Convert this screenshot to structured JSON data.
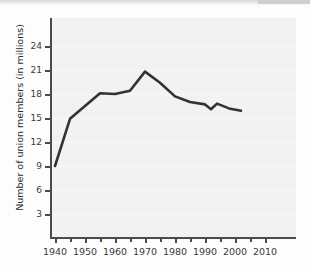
{
  "figure": {
    "y_axis_title": "Number of union members (in millions)"
  },
  "chart_data": {
    "type": "line",
    "title": "",
    "xlabel": "",
    "ylabel": "Number of union members (in millions)",
    "xlim": [
      1936,
      2014
    ],
    "ylim": [
      0,
      26
    ],
    "grid": true,
    "legend": "none",
    "line_color": "#333333",
    "plot_background": "#f2f2f2",
    "x_major_ticks": [
      1940,
      1950,
      1960,
      1970,
      1980,
      1990,
      2000,
      2010
    ],
    "x_minor_ticks": [
      1945,
      1955,
      1965,
      1975,
      1985,
      1995,
      2005
    ],
    "x_tick_labels": [
      "1940",
      "1950",
      "1960",
      "1970",
      "1980",
      "1990",
      "2000",
      "2010"
    ],
    "y_ticks": [
      3,
      6,
      9,
      12,
      15,
      18,
      21,
      24
    ],
    "y_tick_labels": [
      "3",
      "6",
      "9",
      "12",
      "15",
      "18",
      "21",
      "24"
    ],
    "series": [
      {
        "name": "Union members",
        "x": [
          1940,
          1945,
          1950,
          1955,
          1960,
          1965,
          1970,
          1975,
          1980,
          1985,
          1990,
          1992,
          1994,
          1998,
          2002
        ],
        "values": [
          9.0,
          14.9,
          16.5,
          18.1,
          18.0,
          18.4,
          20.8,
          19.4,
          17.7,
          17.0,
          16.7,
          16.1,
          16.8,
          16.2,
          15.9
        ]
      }
    ]
  }
}
